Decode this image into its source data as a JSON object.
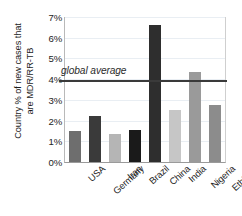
{
  "chart_data": {
    "type": "bar",
    "title": "",
    "xlabel": "",
    "ylabel": "Country % of new cases that are MDR/RR-TB",
    "ylabel_lines": [
      "Country % of new cases that",
      "are MDR/RR-TB"
    ],
    "categories": [
      "USA",
      "Germany",
      "Iran",
      "Brazil",
      "China",
      "India",
      "Nigeria",
      "Ethiopia"
    ],
    "values": [
      1.5,
      2.2,
      1.35,
      1.55,
      6.6,
      2.5,
      4.35,
      2.75
    ],
    "bar_colors": [
      "#6e6e6e",
      "#3a3a3a",
      "#b5b5b5",
      "#1a1a1a",
      "#2e2e2e",
      "#c6c6c6",
      "#9a9a9a",
      "#8c8c8c"
    ],
    "ylim": [
      0,
      7
    ],
    "ytick_values": [
      0,
      1,
      2,
      3,
      4,
      5,
      6,
      7
    ],
    "ytick_labels": [
      "0%",
      "1%",
      "2%",
      "3%",
      "4%",
      "5%",
      "6%",
      "7%"
    ],
    "grid": true,
    "legend": null,
    "annotations": [
      {
        "name": "global-average",
        "label": "global average",
        "value": 3.95,
        "style": "horizontal-reference-line",
        "color": "#3a3a3a"
      }
    ]
  }
}
